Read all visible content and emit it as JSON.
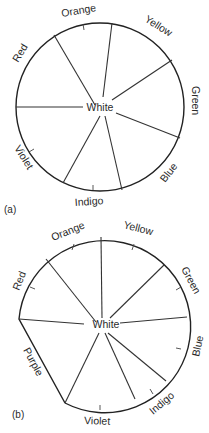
{
  "figure_a": {
    "caption": "(a)",
    "center_label": "White",
    "segments": [
      "Red",
      "Orange",
      "Yellow",
      "Green",
      "Blue",
      "Indigo",
      "Violet"
    ]
  },
  "figure_b": {
    "caption": "(b)",
    "center_label": "White",
    "segments": [
      "Red",
      "Orange",
      "Yellow",
      "Green",
      "Blue",
      "Indigo",
      "Violet",
      "Purple"
    ]
  }
}
